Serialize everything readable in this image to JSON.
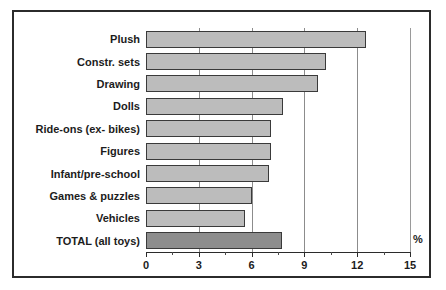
{
  "chart_data": {
    "type": "bar",
    "orientation": "horizontal",
    "title": "",
    "xlabel": "%",
    "ylabel": "",
    "xlim": [
      0,
      15
    ],
    "xticks": [
      0,
      3,
      6,
      9,
      12,
      15
    ],
    "xtick_labels": [
      "0",
      "3",
      "6",
      "9",
      "12",
      "15"
    ],
    "minor_tick_step": 1.5,
    "grid": true,
    "legend": false,
    "categories": [
      "Plush",
      "Constr. sets",
      "Drawing",
      "Dolls",
      "Ride-ons (ex- bikes)",
      "Figures",
      "Infant/pre-school",
      "Games & puzzles",
      "Vehicles",
      "TOTAL (all toys)"
    ],
    "values": [
      12.5,
      10.2,
      9.8,
      7.8,
      7.1,
      7.1,
      7.0,
      6.0,
      5.6,
      7.7
    ],
    "bars": [
      {
        "label": "Plush",
        "value": 12.5,
        "highlight": false
      },
      {
        "label": "Constr. sets",
        "value": 10.2,
        "highlight": false
      },
      {
        "label": "Drawing",
        "value": 9.8,
        "highlight": false
      },
      {
        "label": "Dolls",
        "value": 7.8,
        "highlight": false
      },
      {
        "label": "Ride-ons (ex- bikes)",
        "value": 7.1,
        "highlight": false
      },
      {
        "label": "Figures",
        "value": 7.1,
        "highlight": false
      },
      {
        "label": "Infant/pre-school",
        "value": 7.0,
        "highlight": false
      },
      {
        "label": "Games & puzzles",
        "value": 6.0,
        "highlight": false
      },
      {
        "label": "Vehicles",
        "value": 5.6,
        "highlight": false
      },
      {
        "label": "TOTAL (all toys)",
        "value": 7.7,
        "highlight": true
      }
    ],
    "colors": {
      "bar_fill": "#bcbcbc",
      "bar_fill_highlight": "#8d8d8d",
      "bar_border": "#3a3a3a",
      "gridline": "#8c8c8c",
      "axis": "#2b2b2b",
      "text": "#1c1c1c",
      "frame": "#2b2b2b",
      "background": "#ffffff"
    }
  }
}
